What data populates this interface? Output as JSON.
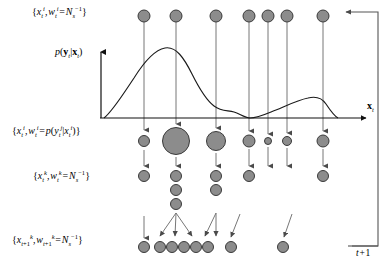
{
  "figure": {
    "type": "diagram",
    "width": 390,
    "height": 269,
    "background": "#ffffff",
    "stroke": "#444444",
    "particle_fill": "#8c8c8c",
    "particle_stroke": "#3a3a3a",
    "curve_color": "#1a1a1a"
  },
  "labels": {
    "row0": "{x_t^i, w_t^i = N_s^-1}",
    "pdf": "p(y_t|x_t)",
    "row1": "{x_t^i, w_t^i = p(y_t^j|x_t^i)}",
    "row2": "{x_t^k, w_t^k = N_s^-1}",
    "row3": "{x_t+1^k, w_t+1^k = N_s^-1}",
    "axis_x": "x_t",
    "time_next": "t+1"
  },
  "rows": {
    "prior": {
      "y": 16,
      "radius": 6,
      "x": [
        144,
        176,
        216,
        249,
        268,
        287,
        323
      ]
    },
    "weighted": {
      "y": 141,
      "x": [
        144,
        176,
        216,
        249,
        268,
        287,
        323
      ],
      "radius": [
        5.5,
        13.5,
        9.5,
        6.0,
        3.5,
        4.5,
        6.0
      ]
    },
    "resampled": {
      "y_top": 176,
      "spacing": 14,
      "radius": 5.5,
      "x": [
        144,
        176,
        216,
        249,
        268,
        287,
        323
      ],
      "counts": [
        1,
        3,
        2,
        1,
        0,
        0,
        1
      ]
    },
    "predicted": {
      "y": 247,
      "radius": 5.5,
      "x": [
        144,
        168,
        178,
        188,
        198,
        208,
        230,
        283
      ]
    }
  },
  "chart_curve": {
    "baseline_y": 118,
    "axis_x_start": 100,
    "axis_x_end": 372,
    "peak1_x": 165,
    "peak1_y": 48,
    "trough_x": 250,
    "bump_x": 318
  }
}
